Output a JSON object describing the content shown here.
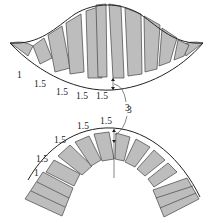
{
  "figure": {
    "top": {
      "name": "bell-shaped-layout",
      "labels": [
        {
          "text": "1",
          "x": 25,
          "y": 79
        },
        {
          "text": "1.5",
          "x": 34,
          "y": 89
        },
        {
          "text": "1.5",
          "x": 56,
          "y": 97
        },
        {
          "text": "1.5",
          "x": 76,
          "y": 100
        },
        {
          "text": "1.5",
          "x": 96,
          "y": 100
        }
      ],
      "callout": {
        "text": "3",
        "x": 118,
        "y": 112
      }
    },
    "bottom": {
      "name": "arch-layout",
      "labels": [
        {
          "text": "1",
          "x": 34,
          "y": 174
        },
        {
          "text": "1.5",
          "x": 36,
          "y": 162
        },
        {
          "text": "1.5",
          "x": 54,
          "y": 144
        },
        {
          "text": "1.5",
          "x": 77,
          "y": 129
        },
        {
          "text": "1.5",
          "x": 99,
          "y": 124
        }
      ],
      "callout": {
        "text": "3",
        "x": 127,
        "y": 113
      }
    },
    "colors": {
      "block_fill": "#bdbdbd",
      "outline": "#222222",
      "background": "#ffffff"
    }
  }
}
